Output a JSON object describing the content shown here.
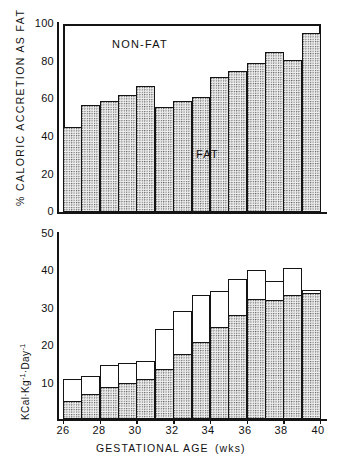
{
  "figure": {
    "top_chart": {
      "ylabel": "% CALORIC ACCRETION AS FAT",
      "yticks": [
        "0",
        "20",
        "40",
        "60",
        "80",
        "100"
      ],
      "annotations": {
        "nonfat": "NON-FAT",
        "fat": "FAT"
      }
    },
    "bottom_chart": {
      "ylabel_prefix": "KCal",
      "ylabel_mid": "Kg",
      "ylabel_suffix": "Day",
      "ylabel_exp1": "-1",
      "ylabel_exp2": "-1",
      "ylabel_full": "KCal·Kg-1·Day-1",
      "yticks": [
        "10",
        "20",
        "30",
        "40",
        "50"
      ]
    },
    "xaxis": {
      "title_main": "GESTATIONAL   AGE",
      "title_unit": "(wks)",
      "ticks": [
        "26",
        "28",
        "30",
        "32",
        "34",
        "36",
        "38",
        "40"
      ]
    }
  },
  "chart_data": [
    {
      "type": "bar",
      "title": "",
      "xlabel": "GESTATIONAL AGE (wks)",
      "ylabel": "% CALORIC ACCRETION AS FAT",
      "ylim": [
        0,
        100
      ],
      "xlim": [
        26,
        40
      ],
      "grid": false,
      "legend": [
        "FAT",
        "NON-FAT"
      ],
      "annotations": [
        {
          "text": "NON-FAT",
          "x": 31.2,
          "y": 89
        },
        {
          "text": "FAT",
          "x": 33.3,
          "y": 35
        }
      ],
      "categories": [
        "26-27",
        "27-28",
        "28-29",
        "29-30",
        "30-31",
        "31-32",
        "32-33",
        "33-34",
        "34-35",
        "35-36",
        "36-37",
        "37-38",
        "38-39",
        "39-40"
      ],
      "x_bin_starts": [
        26,
        27,
        28,
        29,
        30,
        31,
        32,
        33,
        34,
        35,
        36,
        37,
        38,
        39
      ],
      "values": [
        45,
        57,
        59,
        62,
        67,
        56,
        59,
        61,
        72,
        75,
        79,
        85,
        81,
        95
      ]
    },
    {
      "type": "bar",
      "title": "",
      "xlabel": "GESTATIONAL AGE (wks)",
      "ylabel": "KCal·Kg-1·Day-1",
      "ylim": [
        0,
        52
      ],
      "xlim": [
        26,
        40
      ],
      "grid": false,
      "stacked": true,
      "categories": [
        "26-27",
        "27-28",
        "28-29",
        "29-30",
        "30-31",
        "31-32",
        "32-33",
        "33-34",
        "34-35",
        "35-36",
        "36-37",
        "37-38",
        "38-39",
        "39-40"
      ],
      "x_bin_starts": [
        26,
        27,
        28,
        29,
        30,
        31,
        32,
        33,
        34,
        35,
        36,
        37,
        38,
        39
      ],
      "series": [
        {
          "name": "FAT",
          "values": [
            5,
            7,
            9,
            10,
            11,
            14,
            18,
            21.5,
            25.5,
            29,
            33.5,
            33,
            34.5,
            35
          ]
        },
        {
          "name": "NON-FAT",
          "values": [
            6,
            5,
            6,
            5.5,
            5,
            11,
            12,
            13,
            10,
            10,
            8,
            5.5,
            7.5,
            1
          ]
        }
      ],
      "totals": [
        11,
        12,
        15,
        15.5,
        16,
        25,
        30,
        34.5,
        35.5,
        39,
        41.5,
        38.5,
        42,
        36
      ]
    }
  ]
}
